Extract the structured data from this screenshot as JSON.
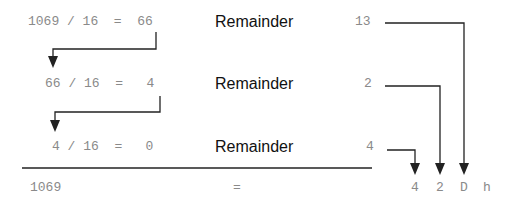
{
  "rows": [
    {
      "equation": "1069 / 16  =  66",
      "label": "Remainder",
      "remainder": "13"
    },
    {
      "equation": "66 / 16  =   4",
      "label": "Remainder",
      "remainder": "2"
    },
    {
      "equation": "4 / 16  =   0",
      "label": "Remainder",
      "remainder": "4"
    }
  ],
  "result": {
    "decimal": "1069",
    "equals": "=",
    "digits": [
      "4",
      "2",
      "D",
      "h"
    ]
  },
  "colors": {
    "line": "#222222",
    "mono_text": "#8a8a8a",
    "label_text": "#111111"
  }
}
